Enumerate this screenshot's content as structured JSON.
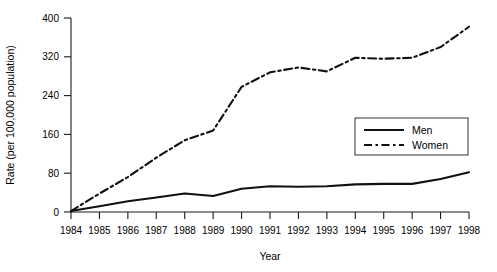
{
  "chart_data": {
    "type": "line",
    "title": "",
    "xlabel": "Year",
    "ylabel": "Rate (per 100,000 population)",
    "categories": [
      1984,
      1985,
      1986,
      1987,
      1988,
      1989,
      1990,
      1991,
      1992,
      1993,
      1994,
      1995,
      1996,
      1997,
      1998
    ],
    "x_tick_labels": [
      "1984",
      "1985",
      "1986",
      "1987",
      "1988",
      "1989",
      "1990",
      "1991",
      "1992",
      "1993",
      "1994",
      "1995",
      "1996",
      "1997",
      "1998"
    ],
    "y_tick_labels": [
      "0",
      "80",
      "160",
      "240",
      "320",
      "400"
    ],
    "y_ticks": [
      0,
      80,
      160,
      240,
      320,
      400
    ],
    "xlim": [
      1984,
      1998
    ],
    "ylim": [
      0,
      400
    ],
    "grid": false,
    "legend_position": "center-right",
    "series": [
      {
        "name": "Men",
        "line_style": "solid",
        "color": "#111111",
        "values": [
          2,
          12,
          22,
          30,
          38,
          33,
          48,
          53,
          52,
          53,
          57,
          58,
          58,
          68,
          82
        ]
      },
      {
        "name": "Women",
        "line_style": "dash-dot",
        "color": "#111111",
        "values": [
          2,
          38,
          72,
          112,
          148,
          168,
          258,
          288,
          298,
          290,
          318,
          316,
          318,
          340,
          382
        ]
      }
    ]
  },
  "legend": {
    "entries": [
      {
        "label": "Men"
      },
      {
        "label": "Women"
      }
    ]
  },
  "axes": {
    "x_title": "Year",
    "y_title": "Rate (per 100,000 population)"
  }
}
